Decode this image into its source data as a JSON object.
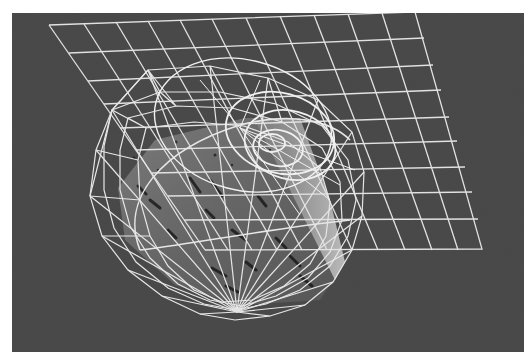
{
  "scene": {
    "background_color": "#4a4a4a",
    "border_color": "#ffffff",
    "wire_color": "#e6e6e6",
    "objects": [
      {
        "name": "grid-plane",
        "type": "wireframe-plane"
      },
      {
        "name": "ellipsoid",
        "type": "wireframe-ellipsoid"
      },
      {
        "name": "circles",
        "type": "wireframe-circles"
      },
      {
        "name": "image-slab",
        "type": "textured-slab"
      }
    ]
  }
}
